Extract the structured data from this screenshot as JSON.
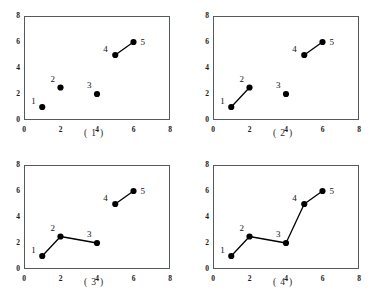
{
  "figure": {
    "axis": {
      "xticks": [
        "0",
        "2",
        "4",
        "6",
        "8"
      ],
      "yticks": [
        "0",
        "2",
        "4",
        "6",
        "8"
      ],
      "xlim": [
        0,
        8
      ],
      "ylim": [
        0,
        8
      ],
      "tick_values_x": [
        0,
        2,
        4,
        6,
        8
      ],
      "tick_values_y": [
        0,
        2,
        4,
        6,
        8
      ]
    },
    "point_labels": [
      "1",
      "2",
      "3",
      "4",
      "5"
    ],
    "captions": [
      "( 1 )",
      "( 2 )",
      "( 3 )",
      "( 4 )"
    ],
    "colors": {
      "marker": "#000000",
      "line": "#000000",
      "frame": "#555a5c",
      "text": "#1a1a1a",
      "background": "#ffffff"
    }
  },
  "chart_data": [
    {
      "type": "scatter",
      "title": "( 1 )",
      "xlabel": "",
      "ylabel": "",
      "xlim": [
        0,
        8
      ],
      "ylim": [
        0,
        8
      ],
      "grid": false,
      "legend": "none",
      "point_labels": [
        "1",
        "2",
        "3",
        "4",
        "5"
      ],
      "x": [
        1,
        2,
        4,
        5,
        6
      ],
      "y": [
        1,
        2.5,
        2,
        5,
        6
      ],
      "edges": [
        [
          3,
          4
        ]
      ],
      "annotation": "Only points 4 and 5 are joined."
    },
    {
      "type": "scatter",
      "title": "( 2 )",
      "xlabel": "",
      "ylabel": "",
      "xlim": [
        0,
        8
      ],
      "ylim": [
        0,
        8
      ],
      "grid": false,
      "legend": "none",
      "point_labels": [
        "1",
        "2",
        "3",
        "4",
        "5"
      ],
      "x": [
        1,
        2,
        4,
        5,
        6
      ],
      "y": [
        1,
        2.5,
        2,
        5,
        6
      ],
      "edges": [
        [
          0,
          1
        ],
        [
          3,
          4
        ]
      ],
      "annotation": "Points 1-2 joined and points 4-5 joined."
    },
    {
      "type": "scatter",
      "title": "( 3 )",
      "xlabel": "",
      "ylabel": "",
      "xlim": [
        0,
        8
      ],
      "ylim": [
        0,
        8
      ],
      "grid": false,
      "legend": "none",
      "point_labels": [
        "1",
        "2",
        "3",
        "4",
        "5"
      ],
      "x": [
        1,
        2,
        4,
        5,
        6
      ],
      "y": [
        1,
        2.5,
        2,
        5,
        6
      ],
      "edges": [
        [
          0,
          1
        ],
        [
          1,
          2
        ],
        [
          3,
          4
        ]
      ],
      "annotation": "Chain 1-2-3 joined and points 4-5 joined."
    },
    {
      "type": "scatter",
      "title": "( 4 )",
      "xlabel": "",
      "ylabel": "",
      "xlim": [
        0,
        8
      ],
      "ylim": [
        0,
        8
      ],
      "grid": false,
      "legend": "none",
      "point_labels": [
        "1",
        "2",
        "3",
        "4",
        "5"
      ],
      "x": [
        1,
        2,
        4,
        5,
        6
      ],
      "y": [
        1,
        2.5,
        2,
        5,
        6
      ],
      "edges": [
        [
          0,
          1
        ],
        [
          1,
          2
        ],
        [
          2,
          3
        ],
        [
          3,
          4
        ]
      ],
      "annotation": "All five points joined into a single chain 1-2-3-4-5."
    }
  ]
}
